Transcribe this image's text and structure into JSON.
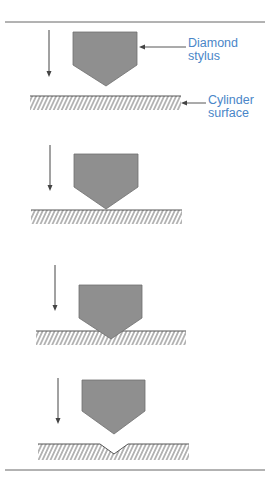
{
  "diagram": {
    "labels": {
      "stylus": [
        "Diamond",
        "stylus"
      ],
      "surface": [
        "Cylinder",
        "surface"
      ]
    },
    "colors": {
      "stylus_fill": "#8f8f8f",
      "stylus_stroke": "#6e6e6e",
      "line": "#555555",
      "label": "#4a86c8",
      "rule": "#666666"
    },
    "stages": [
      {
        "step": 1,
        "description": "stylus above surface"
      },
      {
        "step": 2,
        "description": "stylus touches surface"
      },
      {
        "step": 3,
        "description": "stylus penetrates surface"
      },
      {
        "step": 4,
        "description": "stylus withdrawn, cell engraved"
      }
    ]
  }
}
